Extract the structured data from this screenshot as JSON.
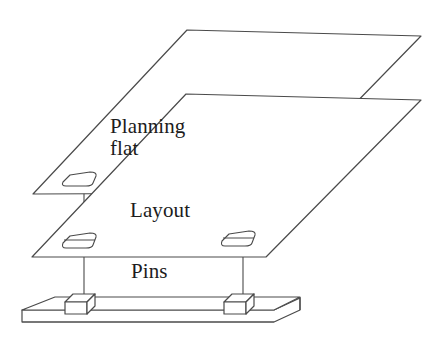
{
  "diagram": {
    "stroke_color": "#4a4a4a",
    "fill_color": "#ffffff",
    "text_color": "#1c1c1c",
    "background": "#ffffff",
    "labels": {
      "planning_flat_line1": "Planning",
      "planning_flat_line2": "flat",
      "layout": "Layout",
      "pins": "Pins"
    },
    "layers": [
      {
        "name": "planning-flat",
        "label": "Planning flat",
        "type": "plane",
        "holes": 2
      },
      {
        "name": "layout",
        "label": "Layout",
        "type": "plane",
        "holes": 2
      },
      {
        "name": "base-plate",
        "label": "Pins",
        "type": "slab",
        "pins": 2
      }
    ],
    "alignment_lines": 2
  }
}
